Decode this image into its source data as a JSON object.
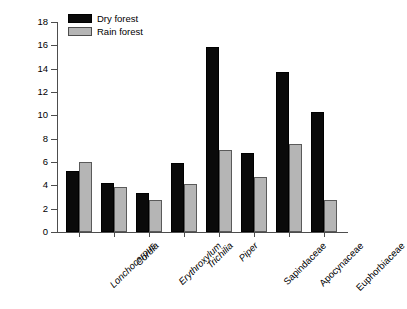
{
  "chart_data": {
    "type": "bar",
    "title": "",
    "xlabel": "",
    "ylabel": "Leaf area eaten (%)",
    "ylim": [
      0,
      18
    ],
    "ytick_labels": [
      "0",
      "2",
      "4",
      "6",
      "8",
      "10",
      "12",
      "14",
      "16",
      "18"
    ],
    "ytick_values": [
      0,
      2,
      4,
      6,
      8,
      10,
      12,
      14,
      16,
      18
    ],
    "grid": false,
    "legend_position": "top-left",
    "categories": [
      "Lonchocarpus",
      "Cordia",
      "Erythroxylum",
      "Trichilia",
      "Piper",
      "Sapindaceae",
      "Apocynaceae",
      "Euphorbiaceae"
    ],
    "category_styles": [
      "italic",
      "italic",
      "italic",
      "italic",
      "italic",
      "upright",
      "upright",
      "upright"
    ],
    "series": [
      {
        "name": "Dry forest",
        "color": "#0a0a0a",
        "values": [
          5.2,
          4.2,
          3.35,
          5.9,
          15.9,
          6.8,
          13.7,
          10.3
        ]
      },
      {
        "name": "Rain forest",
        "color": "#b5b5b5",
        "values": [
          6.0,
          3.9,
          2.75,
          4.1,
          7.05,
          4.7,
          7.55,
          2.75
        ]
      }
    ]
  },
  "legend": {
    "items": [
      {
        "label": "Dry forest"
      },
      {
        "label": "Rain forest"
      }
    ]
  }
}
